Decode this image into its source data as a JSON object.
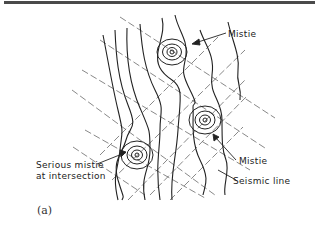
{
  "figure": {
    "panel_label": "(a)",
    "labels": {
      "mistie_top": "Mistie",
      "mistie_right": "Mistie",
      "seismic_line": "Seismic line",
      "serious_mistie_line1": "Serious mistie",
      "serious_mistie_line2": "at intersection"
    },
    "colors": {
      "ink": "#222222",
      "dashed_line": "#555555",
      "top_rule": "#4a4a4a"
    },
    "misties": [
      {
        "name": "mistie-top",
        "cx": 172,
        "cy": 52
      },
      {
        "name": "mistie-right",
        "cx": 205,
        "cy": 120
      },
      {
        "name": "serious-mistie",
        "cx": 137,
        "cy": 155
      }
    ]
  }
}
